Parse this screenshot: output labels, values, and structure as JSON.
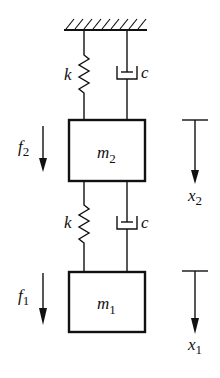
{
  "diagram": {
    "type": "two-mass spring-damper system",
    "ground": {
      "label": ""
    },
    "upper_spring": {
      "label": "k"
    },
    "upper_damper": {
      "label": "c"
    },
    "mass_top": {
      "symbol": "m",
      "subscript": "2"
    },
    "force_top": {
      "symbol": "f",
      "subscript": "2"
    },
    "disp_top": {
      "symbol": "x",
      "subscript": "2"
    },
    "lower_spring": {
      "label": "k"
    },
    "lower_damper": {
      "label": "c"
    },
    "mass_bottom": {
      "symbol": "m",
      "subscript": "1"
    },
    "force_bottom": {
      "symbol": "f",
      "subscript": "1"
    },
    "disp_bottom": {
      "symbol": "x",
      "subscript": "1"
    }
  },
  "colors": {
    "line": "#111111",
    "background": "#ffffff"
  }
}
